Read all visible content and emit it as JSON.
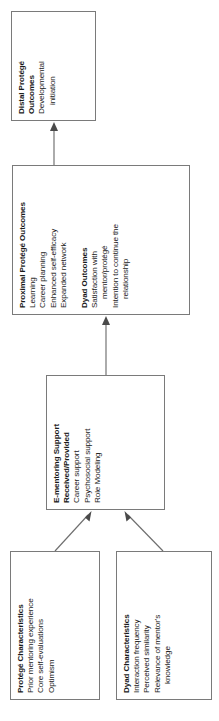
{
  "figure": {
    "type": "conceptual-model-flow-diagram",
    "orientation": "rotated-90-counterclockwise",
    "boxes": [
      {
        "id": "protege-characteristics",
        "title": "Protégé Characteristics",
        "items": [
          "Prior mentoring experience",
          "Core self-evaluations",
          "Optimism"
        ]
      },
      {
        "id": "dyad-characteristics",
        "title": "Dyad Characteristics",
        "items": [
          "Interaction frequency",
          "Perceived similarity",
          "Relevance of mentor's",
          "knowledge"
        ]
      },
      {
        "id": "e-mentoring-support",
        "title": "E-mentoring Support\nReceived/Provided",
        "items": [
          "Career support",
          "Psychosocial support",
          "Role Modeling"
        ]
      },
      {
        "id": "proximal-protege-outcomes",
        "title": "Proximal Protégé Outcomes",
        "items": [
          "Learning",
          "Career planning",
          "Enhanced self-efficacy",
          "Expanded network"
        ]
      },
      {
        "id": "dyad-outcomes",
        "title": "Dyad Outcomes",
        "items": [
          "Satisfaction with",
          "mentor/protégé",
          "Intention to continue the",
          "relationship"
        ]
      },
      {
        "id": "distal-protege-outcomes",
        "title": "Distal Protégé\nOutcomes",
        "items": [
          "Developmental",
          "initiation"
        ]
      }
    ],
    "edges": [
      {
        "from": "protege-characteristics",
        "to": "e-mentoring-support",
        "style": "diagonal-arrow"
      },
      {
        "from": "dyad-characteristics",
        "to": "e-mentoring-support",
        "style": "diagonal-arrow"
      },
      {
        "from": "e-mentoring-support",
        "to": "proximal-protege-outcomes",
        "style": "straight-arrow"
      },
      {
        "from": "proximal-protege-outcomes",
        "to": "distal-protege-outcomes",
        "style": "straight-arrow"
      }
    ],
    "colors": {
      "box_border": "#7a7a7a",
      "connector": "#6e6e6e",
      "arrowhead": "#4a4a4a",
      "text": "#1a1a1a",
      "background": "#ffffff"
    }
  }
}
